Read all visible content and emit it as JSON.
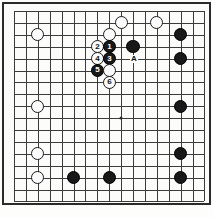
{
  "diagram": {
    "kind": "go-board-diagram",
    "caption": "",
    "board": {
      "columns": 17,
      "rows": 17,
      "cell_px": 11.9,
      "origin_x": 12,
      "origin_y": 9,
      "line_color": "#3b3b3b",
      "border_color": "#2b2b2b",
      "background_color": "#fcfcfa"
    },
    "hoshi_points": [
      {
        "col": 9,
        "row": 9
      }
    ],
    "stones": [
      {
        "id": "w-upper-left-corner",
        "color": "white",
        "col": 2,
        "row": 2,
        "label": ""
      },
      {
        "id": "w-top-a",
        "color": "white",
        "col": 9,
        "row": 1,
        "label": ""
      },
      {
        "id": "w-top-b",
        "color": "white",
        "col": 12,
        "row": 1,
        "label": ""
      },
      {
        "id": "w-contact-top",
        "color": "white",
        "col": 8,
        "row": 2,
        "label": ""
      },
      {
        "id": "w-move-2",
        "color": "white",
        "col": 7,
        "row": 3,
        "label": "2"
      },
      {
        "id": "b-move-1",
        "color": "black",
        "col": 8,
        "row": 3,
        "label": "1"
      },
      {
        "id": "w-move-4",
        "color": "white",
        "col": 7,
        "row": 4,
        "label": "4"
      },
      {
        "id": "b-move-3",
        "color": "black",
        "col": 8,
        "row": 4,
        "label": "3"
      },
      {
        "id": "b-move-5",
        "color": "black",
        "col": 7,
        "row": 5,
        "label": "5"
      },
      {
        "id": "w-below-3",
        "color": "white",
        "col": 8,
        "row": 5,
        "label": ""
      },
      {
        "id": "w-move-6",
        "color": "white",
        "col": 8,
        "row": 6,
        "label": "6"
      },
      {
        "id": "b-right-of-1",
        "color": "black",
        "col": 10,
        "row": 3,
        "label": ""
      },
      {
        "id": "b-right-1",
        "color": "black",
        "col": 14,
        "row": 2,
        "label": ""
      },
      {
        "id": "b-right-2",
        "color": "black",
        "col": 14,
        "row": 4,
        "label": ""
      },
      {
        "id": "b-right-3",
        "color": "black",
        "col": 14,
        "row": 8,
        "label": ""
      },
      {
        "id": "b-right-4",
        "color": "black",
        "col": 14,
        "row": 12,
        "label": ""
      },
      {
        "id": "b-right-5",
        "color": "black",
        "col": 14,
        "row": 14,
        "label": ""
      },
      {
        "id": "w-left-2",
        "color": "white",
        "col": 2,
        "row": 8,
        "label": ""
      },
      {
        "id": "w-left-3",
        "color": "white",
        "col": 2,
        "row": 12,
        "label": ""
      },
      {
        "id": "w-left-4",
        "color": "white",
        "col": 2,
        "row": 14,
        "label": ""
      },
      {
        "id": "b-bottom-1",
        "color": "black",
        "col": 5,
        "row": 14,
        "label": ""
      },
      {
        "id": "b-bottom-2",
        "color": "black",
        "col": 8,
        "row": 14,
        "label": ""
      }
    ],
    "point_labels": [
      {
        "id": "label-A",
        "text": "A",
        "col": 10,
        "row": 4
      }
    ]
  }
}
